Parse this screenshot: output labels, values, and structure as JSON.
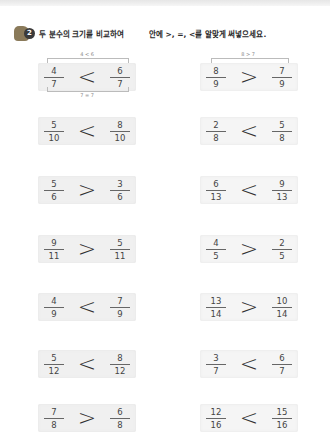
{
  "header": {
    "badge_number": "2",
    "instruction_part1": "두 분수의 크기를 비교하여",
    "instruction_part2": "안에 >, =, <를 알맞게 써넣으세요."
  },
  "hints": {
    "item1_top": "4 < 6",
    "item1_bottom": "7 = 7",
    "item2_top": "8 > 7"
  },
  "problems": [
    {
      "left_num": "4",
      "left_den": "7",
      "symbol": "<",
      "right_num": "6",
      "right_den": "7"
    },
    {
      "left_num": "8",
      "left_den": "9",
      "symbol": ">",
      "right_num": "7",
      "right_den": "9"
    },
    {
      "left_num": "5",
      "left_den": "10",
      "symbol": "<",
      "right_num": "8",
      "right_den": "10"
    },
    {
      "left_num": "2",
      "left_den": "8",
      "symbol": "<",
      "right_num": "5",
      "right_den": "8"
    },
    {
      "left_num": "5",
      "left_den": "6",
      "symbol": ">",
      "right_num": "3",
      "right_den": "6"
    },
    {
      "left_num": "6",
      "left_den": "13",
      "symbol": "<",
      "right_num": "9",
      "right_den": "13"
    },
    {
      "left_num": "9",
      "left_den": "11",
      "symbol": ">",
      "right_num": "5",
      "right_den": "11"
    },
    {
      "left_num": "4",
      "left_den": "5",
      "symbol": ">",
      "right_num": "2",
      "right_den": "5"
    },
    {
      "left_num": "4",
      "left_den": "9",
      "symbol": "<",
      "right_num": "7",
      "right_den": "9"
    },
    {
      "left_num": "13",
      "left_den": "14",
      "symbol": ">",
      "right_num": "10",
      "right_den": "14"
    },
    {
      "left_num": "5",
      "left_den": "12",
      "symbol": "<",
      "right_num": "8",
      "right_den": "12"
    },
    {
      "left_num": "3",
      "left_den": "7",
      "symbol": "<",
      "right_num": "6",
      "right_den": "7"
    },
    {
      "left_num": "7",
      "left_den": "8",
      "symbol": ">",
      "right_num": "6",
      "right_den": "8"
    },
    {
      "left_num": "12",
      "left_den": "16",
      "symbol": "<",
      "right_num": "15",
      "right_den": "16"
    }
  ]
}
